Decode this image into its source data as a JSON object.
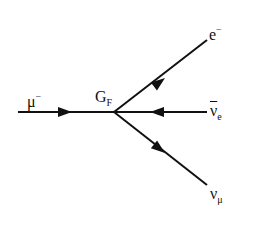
{
  "diagram": {
    "type": "feynman",
    "vertex": {
      "label_main": "G",
      "label_sub": "F"
    },
    "particles": {
      "incoming": {
        "main": "μ",
        "sup": "−"
      },
      "electron": {
        "main": "e",
        "sup": "−"
      },
      "anti_electron_neutrino": {
        "main": "ν",
        "sub": "e"
      },
      "muon_neutrino": {
        "main": "ν",
        "sub": "μ"
      }
    }
  }
}
